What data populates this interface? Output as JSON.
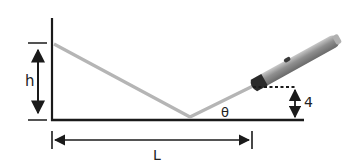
{
  "diagram": {
    "labels": {
      "height": "h",
      "length": "L",
      "angle": "θ",
      "pointer_height": "4"
    },
    "colors": {
      "line": "#1a1a1a",
      "beam": "#b5b5b5",
      "pointer_body": "#8a8a8a",
      "pointer_tip": "#2a2a2a"
    },
    "elements": {
      "wall": "vertical wall",
      "floor": "floor",
      "beam": "reflected laser beam",
      "pointer": "laser pointer"
    }
  }
}
